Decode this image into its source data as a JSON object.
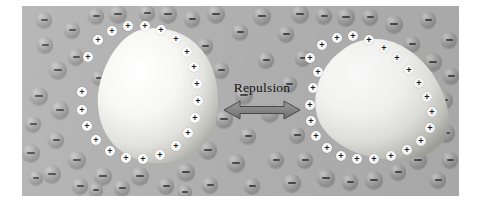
{
  "figure": {
    "panel": {
      "background_color": "#b0b0b0",
      "x": 22,
      "y": 6,
      "width": 437,
      "height": 190
    }
  },
  "annotation": {
    "label": "Repulsion",
    "arrow": {
      "name": "double-headed-arrow",
      "direction": "bidirectional-horizontal",
      "color": "#8c8c8c",
      "outline_color": "#4f4f4f"
    }
  },
  "legend_semantics": {
    "positive_charge_symbol": "+",
    "negative_charge_symbol": "−",
    "positive_marker_color": "#ffffff",
    "negative_marker_color": "#a0a0a0",
    "particle_fill": "#f4f4f2"
  },
  "particles": [
    {
      "name": "colloidal-particle-left",
      "shape": "rounded-irregular-blob",
      "cx": 140,
      "cy": 104,
      "rx": 58,
      "ry": 52,
      "surface_charge": "+",
      "surface_charge_count": 22
    },
    {
      "name": "colloidal-particle-right",
      "shape": "tilted-egg-blob",
      "cx": 371,
      "cy": 108,
      "rx": 62,
      "ry": 50,
      "rotation_deg": -22,
      "surface_charge": "+",
      "surface_charge_count": 24
    }
  ],
  "surface_charges_left": [
    {
      "x": 98,
      "y": 40,
      "sym": "+"
    },
    {
      "x": 112,
      "y": 31,
      "sym": "+"
    },
    {
      "x": 128,
      "y": 26,
      "sym": "+"
    },
    {
      "x": 145,
      "y": 26,
      "sym": "+"
    },
    {
      "x": 161,
      "y": 30,
      "sym": "+"
    },
    {
      "x": 176,
      "y": 39,
      "sym": "+"
    },
    {
      "x": 187,
      "y": 52,
      "sym": "+"
    },
    {
      "x": 194,
      "y": 67,
      "sym": "+"
    },
    {
      "x": 197,
      "y": 84,
      "sym": "+"
    },
    {
      "x": 198,
      "y": 101,
      "sym": "+"
    },
    {
      "x": 195,
      "y": 118,
      "sym": "+"
    },
    {
      "x": 188,
      "y": 133,
      "sym": "+"
    },
    {
      "x": 176,
      "y": 146,
      "sym": "+"
    },
    {
      "x": 160,
      "y": 155,
      "sym": "+"
    },
    {
      "x": 143,
      "y": 159,
      "sym": "+"
    },
    {
      "x": 126,
      "y": 158,
      "sym": "+"
    },
    {
      "x": 110,
      "y": 151,
      "sym": "+"
    },
    {
      "x": 96,
      "y": 140,
      "sym": "+"
    },
    {
      "x": 87,
      "y": 126,
      "sym": "+"
    },
    {
      "x": 82,
      "y": 110,
      "sym": "+"
    },
    {
      "x": 82,
      "y": 92,
      "sym": "+"
    },
    {
      "x": 88,
      "y": 57,
      "sym": "+"
    }
  ],
  "surface_charges_right": [
    {
      "x": 318,
      "y": 72,
      "sym": "+"
    },
    {
      "x": 310,
      "y": 58,
      "sym": "+"
    },
    {
      "x": 322,
      "y": 45,
      "sym": "+"
    },
    {
      "x": 337,
      "y": 38,
      "sym": "+"
    },
    {
      "x": 353,
      "y": 36,
      "sym": "+"
    },
    {
      "x": 369,
      "y": 40,
      "sym": "+"
    },
    {
      "x": 384,
      "y": 48,
      "sym": "+"
    },
    {
      "x": 397,
      "y": 58,
      "sym": "+"
    },
    {
      "x": 409,
      "y": 70,
      "sym": "+"
    },
    {
      "x": 419,
      "y": 83,
      "sym": "+"
    },
    {
      "x": 427,
      "y": 97,
      "sym": "+"
    },
    {
      "x": 432,
      "y": 112,
      "sym": "+"
    },
    {
      "x": 430,
      "y": 128,
      "sym": "+"
    },
    {
      "x": 421,
      "y": 141,
      "sym": "+"
    },
    {
      "x": 407,
      "y": 150,
      "sym": "+"
    },
    {
      "x": 391,
      "y": 156,
      "sym": "+"
    },
    {
      "x": 374,
      "y": 159,
      "sym": "+"
    },
    {
      "x": 357,
      "y": 159,
      "sym": "+"
    },
    {
      "x": 341,
      "y": 156,
      "sym": "+"
    },
    {
      "x": 327,
      "y": 148,
      "sym": "+"
    },
    {
      "x": 316,
      "y": 136,
      "sym": "+"
    },
    {
      "x": 311,
      "y": 121,
      "sym": "+"
    },
    {
      "x": 310,
      "y": 105,
      "sym": "+"
    },
    {
      "x": 313,
      "y": 88,
      "sym": "+"
    }
  ],
  "counter_ions": [
    {
      "x": 39,
      "y": 96,
      "r": 9,
      "sym": "−"
    },
    {
      "x": 33,
      "y": 124,
      "r": 8,
      "sym": "−"
    },
    {
      "x": 31,
      "y": 153,
      "r": 9,
      "sym": "−"
    },
    {
      "x": 45,
      "y": 45,
      "r": 8,
      "sym": "−"
    },
    {
      "x": 44,
      "y": 20,
      "r": 8,
      "sym": "−"
    },
    {
      "x": 58,
      "y": 70,
      "r": 9,
      "sym": "−"
    },
    {
      "x": 60,
      "y": 110,
      "r": 9,
      "sym": "−"
    },
    {
      "x": 56,
      "y": 140,
      "r": 8,
      "sym": "−"
    },
    {
      "x": 52,
      "y": 174,
      "r": 9,
      "sym": "−"
    },
    {
      "x": 72,
      "y": 30,
      "r": 8,
      "sym": "−"
    },
    {
      "x": 76,
      "y": 57,
      "r": 8,
      "sym": "−"
    },
    {
      "x": 77,
      "y": 160,
      "r": 9,
      "sym": "−"
    },
    {
      "x": 80,
      "y": 186,
      "r": 8,
      "sym": "−"
    },
    {
      "x": 96,
      "y": 16,
      "r": 8,
      "sym": "−"
    },
    {
      "x": 99,
      "y": 78,
      "r": 7,
      "sym": "−"
    },
    {
      "x": 103,
      "y": 176,
      "r": 9,
      "sym": "−"
    },
    {
      "x": 118,
      "y": 14,
      "r": 9,
      "sym": "−"
    },
    {
      "x": 122,
      "y": 188,
      "r": 8,
      "sym": "−"
    },
    {
      "x": 140,
      "y": 176,
      "r": 9,
      "sym": "−"
    },
    {
      "x": 147,
      "y": 13,
      "r": 8,
      "sym": "−"
    },
    {
      "x": 168,
      "y": 14,
      "r": 9,
      "sym": "−"
    },
    {
      "x": 166,
      "y": 186,
      "r": 8,
      "sym": "−"
    },
    {
      "x": 186,
      "y": 172,
      "r": 9,
      "sym": "−"
    },
    {
      "x": 192,
      "y": 19,
      "r": 8,
      "sym": "−"
    },
    {
      "x": 205,
      "y": 46,
      "r": 8,
      "sym": "−"
    },
    {
      "x": 208,
      "y": 150,
      "r": 9,
      "sym": "−"
    },
    {
      "x": 210,
      "y": 185,
      "r": 8,
      "sym": "−"
    },
    {
      "x": 216,
      "y": 14,
      "r": 9,
      "sym": "−"
    },
    {
      "x": 221,
      "y": 70,
      "r": 8,
      "sym": "−"
    },
    {
      "x": 224,
      "y": 119,
      "r": 9,
      "sym": "−"
    },
    {
      "x": 236,
      "y": 163,
      "r": 9,
      "sym": "−"
    },
    {
      "x": 240,
      "y": 32,
      "r": 8,
      "sym": "−"
    },
    {
      "x": 244,
      "y": 95,
      "r": 9,
      "sym": "−"
    },
    {
      "x": 248,
      "y": 136,
      "r": 8,
      "sym": "−"
    },
    {
      "x": 252,
      "y": 186,
      "r": 8,
      "sym": "−"
    },
    {
      "x": 262,
      "y": 16,
      "r": 9,
      "sym": "−"
    },
    {
      "x": 266,
      "y": 60,
      "r": 8,
      "sym": "−"
    },
    {
      "x": 270,
      "y": 113,
      "r": 9,
      "sym": "−"
    },
    {
      "x": 276,
      "y": 160,
      "r": 8,
      "sym": "−"
    },
    {
      "x": 286,
      "y": 34,
      "r": 8,
      "sym": "−"
    },
    {
      "x": 289,
      "y": 84,
      "r": 8,
      "sym": "−"
    },
    {
      "x": 292,
      "y": 183,
      "r": 9,
      "sym": "−"
    },
    {
      "x": 297,
      "y": 135,
      "r": 8,
      "sym": "−"
    },
    {
      "x": 300,
      "y": 14,
      "r": 9,
      "sym": "−"
    },
    {
      "x": 303,
      "y": 58,
      "r": 8,
      "sym": "−"
    },
    {
      "x": 305,
      "y": 160,
      "r": 8,
      "sym": "−"
    },
    {
      "x": 324,
      "y": 16,
      "r": 8,
      "sym": "−"
    },
    {
      "x": 326,
      "y": 178,
      "r": 9,
      "sym": "−"
    },
    {
      "x": 346,
      "y": 17,
      "r": 9,
      "sym": "−"
    },
    {
      "x": 350,
      "y": 182,
      "r": 8,
      "sym": "−"
    },
    {
      "x": 370,
      "y": 17,
      "r": 8,
      "sym": "−"
    },
    {
      "x": 374,
      "y": 180,
      "r": 9,
      "sym": "−"
    },
    {
      "x": 394,
      "y": 24,
      "r": 9,
      "sym": "−"
    },
    {
      "x": 398,
      "y": 172,
      "r": 8,
      "sym": "−"
    },
    {
      "x": 412,
      "y": 44,
      "r": 8,
      "sym": "−"
    },
    {
      "x": 418,
      "y": 160,
      "r": 9,
      "sym": "−"
    },
    {
      "x": 428,
      "y": 20,
      "r": 8,
      "sym": "−"
    },
    {
      "x": 433,
      "y": 62,
      "r": 9,
      "sym": "−"
    },
    {
      "x": 438,
      "y": 180,
      "r": 8,
      "sym": "−"
    },
    {
      "x": 444,
      "y": 100,
      "r": 9,
      "sym": "−"
    },
    {
      "x": 446,
      "y": 133,
      "r": 9,
      "sym": "−"
    },
    {
      "x": 449,
      "y": 40,
      "r": 8,
      "sym": "−"
    },
    {
      "x": 450,
      "y": 160,
      "r": 8,
      "sym": "−"
    },
    {
      "x": 451,
      "y": 76,
      "r": 8,
      "sym": "−"
    },
    {
      "x": 96,
      "y": 190,
      "r": 7,
      "sym": "−"
    },
    {
      "x": 185,
      "y": 192,
      "r": 7,
      "sym": "−"
    },
    {
      "x": 36,
      "y": 178,
      "r": 7,
      "sym": "−"
    }
  ]
}
